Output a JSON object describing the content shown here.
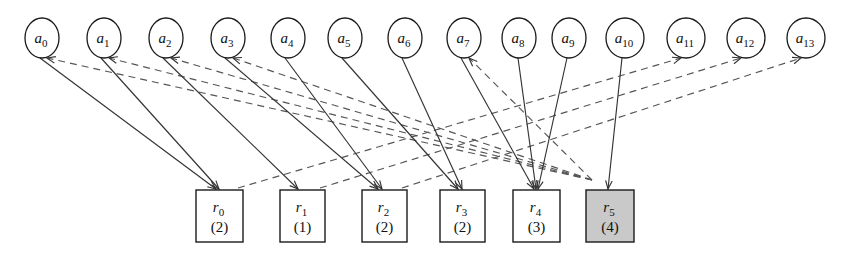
{
  "diagram": {
    "type": "bipartite-graph",
    "canvas": {
      "width": 850,
      "height": 264
    },
    "colors": {
      "background": "#ffffff",
      "stroke": "#1a1a1a",
      "edge_solid": "#333333",
      "edge_dashed": "#555555",
      "highlight_fill": "#c9c9c9",
      "node_fill": "#ffffff"
    },
    "top_nodes": [
      {
        "id": "a0",
        "base": "a",
        "sub": "0",
        "cx": 42,
        "cy": 38,
        "rx": 17,
        "ry": 20
      },
      {
        "id": "a1",
        "base": "a",
        "sub": "1",
        "cx": 104,
        "cy": 38,
        "rx": 17,
        "ry": 20
      },
      {
        "id": "a2",
        "base": "a",
        "sub": "2",
        "cx": 166,
        "cy": 38,
        "rx": 17,
        "ry": 20
      },
      {
        "id": "a3",
        "base": "a",
        "sub": "3",
        "cx": 228,
        "cy": 38,
        "rx": 17,
        "ry": 20
      },
      {
        "id": "a4",
        "base": "a",
        "sub": "4",
        "cx": 288,
        "cy": 38,
        "rx": 17,
        "ry": 20
      },
      {
        "id": "a5",
        "base": "a",
        "sub": "5",
        "cx": 345,
        "cy": 38,
        "rx": 17,
        "ry": 20
      },
      {
        "id": "a6",
        "base": "a",
        "sub": "6",
        "cx": 405,
        "cy": 38,
        "rx": 17,
        "ry": 20
      },
      {
        "id": "a7",
        "base": "a",
        "sub": "7",
        "cx": 464,
        "cy": 38,
        "rx": 17,
        "ry": 20
      },
      {
        "id": "a8",
        "base": "a",
        "sub": "8",
        "cx": 519,
        "cy": 38,
        "rx": 17,
        "ry": 20
      },
      {
        "id": "a9",
        "base": "a",
        "sub": "9",
        "cx": 569,
        "cy": 38,
        "rx": 17,
        "ry": 20
      },
      {
        "id": "a10",
        "base": "a",
        "sub": "10",
        "cx": 625,
        "cy": 38,
        "rx": 19,
        "ry": 20
      },
      {
        "id": "a11",
        "base": "a",
        "sub": "11",
        "cx": 686,
        "cy": 38,
        "rx": 19,
        "ry": 20
      },
      {
        "id": "a12",
        "base": "a",
        "sub": "12",
        "cx": 746,
        "cy": 38,
        "rx": 19,
        "ry": 20
      },
      {
        "id": "a13",
        "base": "a",
        "sub": "13",
        "cx": 806,
        "cy": 38,
        "rx": 19,
        "ry": 20
      }
    ],
    "bottom_nodes": [
      {
        "id": "r0",
        "base": "r",
        "sub": "0",
        "count": "(2)",
        "x": 196,
        "y": 190,
        "w": 47,
        "h": 52,
        "shaded": false
      },
      {
        "id": "r1",
        "base": "r",
        "sub": "1",
        "count": "(1)",
        "x": 280,
        "y": 190,
        "w": 45,
        "h": 52,
        "shaded": false
      },
      {
        "id": "r2",
        "base": "r",
        "sub": "2",
        "count": "(2)",
        "x": 362,
        "y": 190,
        "w": 45,
        "h": 52,
        "shaded": false
      },
      {
        "id": "r3",
        "base": "r",
        "sub": "3",
        "count": "(2)",
        "x": 440,
        "y": 190,
        "w": 45,
        "h": 52,
        "shaded": false
      },
      {
        "id": "r4",
        "base": "r",
        "sub": "4",
        "count": "(3)",
        "x": 513,
        "y": 190,
        "w": 47,
        "h": 52,
        "shaded": false
      },
      {
        "id": "r5",
        "base": "r",
        "sub": "5",
        "count": "(4)",
        "x": 586,
        "y": 190,
        "w": 48,
        "h": 52,
        "shaded": true
      }
    ],
    "solid_edges": [
      {
        "from": "a0",
        "to": "r0",
        "x1": 40,
        "y1": 58,
        "x2": 216,
        "y2": 189
      },
      {
        "from": "a1",
        "to": "r0",
        "x1": 101,
        "y1": 58,
        "x2": 219,
        "y2": 189
      },
      {
        "from": "a2",
        "to": "r1",
        "x1": 163,
        "y1": 58,
        "x2": 298,
        "y2": 189
      },
      {
        "from": "a3",
        "to": "r2",
        "x1": 225,
        "y1": 58,
        "x2": 378,
        "y2": 189
      },
      {
        "from": "a4",
        "to": "r2",
        "x1": 285,
        "y1": 58,
        "x2": 382,
        "y2": 189
      },
      {
        "from": "a5",
        "to": "r3",
        "x1": 342,
        "y1": 58,
        "x2": 458,
        "y2": 189
      },
      {
        "from": "a6",
        "to": "r3",
        "x1": 402,
        "y1": 58,
        "x2": 462,
        "y2": 189
      },
      {
        "from": "a7",
        "to": "r4",
        "x1": 461,
        "y1": 58,
        "x2": 534,
        "y2": 189
      },
      {
        "from": "a8",
        "to": "r4",
        "x1": 518,
        "y1": 58,
        "x2": 536,
        "y2": 189
      },
      {
        "from": "a9",
        "to": "r4",
        "x1": 567,
        "y1": 58,
        "x2": 538,
        "y2": 189
      },
      {
        "from": "a10",
        "to": "r5",
        "x1": 622,
        "y1": 58,
        "x2": 608,
        "y2": 189
      }
    ],
    "dashed_edges": [
      {
        "from": "r5",
        "to": "a0",
        "x1": 592,
        "y1": 180,
        "x2": 47,
        "y2": 58
      },
      {
        "from": "r5",
        "to": "a1",
        "x1": 592,
        "y1": 180,
        "x2": 109,
        "y2": 58
      },
      {
        "from": "r5",
        "to": "a2",
        "x1": 592,
        "y1": 180,
        "x2": 171,
        "y2": 58
      },
      {
        "from": "r5",
        "to": "a3",
        "x1": 592,
        "y1": 180,
        "x2": 233,
        "y2": 58
      },
      {
        "from": "r5",
        "to": "a7",
        "x1": 592,
        "y1": 180,
        "x2": 469,
        "y2": 58
      },
      {
        "from": "r0",
        "to": "a11",
        "x1": 238,
        "y1": 188,
        "x2": 681,
        "y2": 58
      },
      {
        "from": "r1",
        "to": "a12",
        "x1": 320,
        "y1": 188,
        "x2": 741,
        "y2": 58
      },
      {
        "from": "r2",
        "to": "a13",
        "x1": 402,
        "y1": 188,
        "x2": 801,
        "y2": 58
      }
    ]
  }
}
